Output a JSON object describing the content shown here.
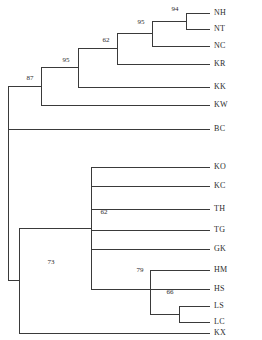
{
  "figure": {
    "type": "phylogenetic-tree",
    "style": "rectangular-cladogram",
    "background_color": "#ffffff",
    "line_color": "#3a3a3a",
    "text_color": "#2b2b2b"
  },
  "chart_data": {
    "type": "tree",
    "title": "",
    "xlabel": "",
    "ylabel": "",
    "layout": "rectangular cladogram, root at left, tips right-aligned",
    "tip_count": 17,
    "tips": [
      {
        "id": "t0",
        "label": "NH",
        "x": 210,
        "y": 13
      },
      {
        "id": "t1",
        "label": "NT",
        "x": 210,
        "y": 29
      },
      {
        "id": "t2",
        "label": "NC",
        "x": 210,
        "y": 46
      },
      {
        "id": "t3",
        "label": "KR",
        "x": 210,
        "y": 64
      },
      {
        "id": "t4",
        "label": "KK",
        "x": 210,
        "y": 87
      },
      {
        "id": "t5",
        "label": "KW",
        "x": 210,
        "y": 105
      },
      {
        "id": "t6",
        "label": "BC",
        "x": 210,
        "y": 129
      },
      {
        "id": "t7",
        "label": "KO",
        "x": 210,
        "y": 167
      },
      {
        "id": "t8",
        "label": "KC",
        "x": 210,
        "y": 186
      },
      {
        "id": "t9",
        "label": "TH",
        "x": 210,
        "y": 209
      },
      {
        "id": "t10",
        "label": "TG",
        "x": 210,
        "y": 230
      },
      {
        "id": "t11",
        "label": "GK",
        "x": 210,
        "y": 249
      },
      {
        "id": "t12",
        "label": "HM",
        "x": 210,
        "y": 270
      },
      {
        "id": "t13",
        "label": "HS",
        "x": 210,
        "y": 289
      },
      {
        "id": "t14",
        "label": "LS",
        "x": 210,
        "y": 306
      },
      {
        "id": "t15",
        "label": "LC",
        "x": 210,
        "y": 322
      },
      {
        "id": "t16",
        "label": "KX",
        "x": 210,
        "y": 333
      }
    ],
    "support_values": [
      94,
      95,
      62,
      95,
      87,
      62,
      79,
      66,
      73
    ],
    "nodes": [
      {
        "id": "n_nh_nt",
        "support": 94,
        "x": 186,
        "y_top": 13,
        "y_bottom": 29,
        "label_x": 175,
        "label_y": 11
      },
      {
        "id": "n_nhnt_nc",
        "support": 95,
        "x": 152,
        "y_top": 21,
        "y_bottom": 46,
        "label_x": 141,
        "label_y": 24
      },
      {
        "id": "n_upper_kr",
        "support": 62,
        "x": 117,
        "y_top": 33,
        "y_bottom": 64,
        "label_x": 106,
        "label_y": 42
      },
      {
        "id": "n_upper_kk",
        "support": 95,
        "x": 78,
        "y_top": 48,
        "y_bottom": 87,
        "label_x": 66,
        "label_y": 62
      },
      {
        "id": "n_upper_kw",
        "support": 87,
        "x": 41,
        "y_top": 67,
        "y_bottom": 105,
        "label_x": 30,
        "label_y": 80
      },
      {
        "id": "n_ko_group",
        "support": 62,
        "x": 91,
        "y_top": 167,
        "y_bottom": 289,
        "label_x": 104,
        "label_y": 214
      },
      {
        "id": "n_hm_clade",
        "support": 79,
        "x": 150,
        "y_top": 270,
        "y_bottom": 314,
        "label_x": 140,
        "label_y": 272
      },
      {
        "id": "n_ls_lc",
        "support": 66,
        "x": 179,
        "y_top": 306,
        "y_bottom": 322,
        "label_x": 170,
        "label_y": 294
      },
      {
        "id": "n_lower_root",
        "support": 73,
        "x": 19,
        "y_top": 228,
        "y_bottom": 333,
        "label_x": 51,
        "label_y": 264
      }
    ],
    "clades": [
      {
        "name": "upper clade",
        "members": [
          "NH",
          "NT",
          "NC",
          "KR",
          "KK",
          "KW"
        ],
        "root_support": 87
      },
      {
        "name": "outgroup branch",
        "members": [
          "BC"
        ],
        "root_support": null
      },
      {
        "name": "lower clade",
        "members": [
          "KO",
          "KC",
          "TH",
          "TG",
          "GK",
          "HM",
          "HS",
          "LS",
          "LC",
          "KX"
        ],
        "root_support": 73
      }
    ]
  }
}
